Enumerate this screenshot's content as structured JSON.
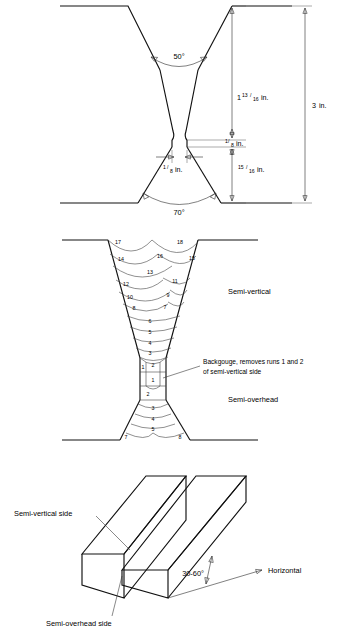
{
  "figure": {
    "ink_color": "#111111",
    "background_color": "#ffffff"
  },
  "groove_detail": {
    "name": "groove-preparation-cross-section",
    "upper_angle": "50°",
    "lower_angle": "70°",
    "root_gap": {
      "whole": "",
      "num": "1",
      "den": "8",
      "unit": "in."
    },
    "upper_depth": {
      "whole": "1",
      "num": "13",
      "den": "16",
      "unit": "in."
    },
    "root_face": {
      "whole": "",
      "num": "1",
      "den": "8",
      "unit": "in."
    },
    "lower_depth": {
      "whole": "",
      "num": "15",
      "den": "16",
      "unit": "in."
    },
    "total_thickness": {
      "whole": "3",
      "num": "",
      "den": "",
      "unit": "in."
    }
  },
  "run_sequence": {
    "name": "weld-run-sequence",
    "semi_vertical_label": "Semi-vertical",
    "semi_overhead_label": "Semi-overhead",
    "backgouge_note_line1": "Backgouge, removes runs 1 and 2",
    "backgouge_note_line2": "of semi-vertical side",
    "semi_vertical_runs": [
      {
        "n": "17",
        "x": 118,
        "y": 16
      },
      {
        "n": "18",
        "x": 180,
        "y": 16
      },
      {
        "n": "14",
        "x": 121,
        "y": 33
      },
      {
        "n": "16",
        "x": 160,
        "y": 30
      },
      {
        "n": "15",
        "x": 192,
        "y": 32
      },
      {
        "n": "13",
        "x": 150,
        "y": 46
      },
      {
        "n": "12",
        "x": 126,
        "y": 58
      },
      {
        "n": "11",
        "x": 175,
        "y": 55
      },
      {
        "n": "10",
        "x": 130,
        "y": 71
      },
      {
        "n": "9",
        "x": 168,
        "y": 69
      },
      {
        "n": "8",
        "x": 134,
        "y": 82
      },
      {
        "n": "7",
        "x": 165,
        "y": 81
      },
      {
        "n": "6",
        "x": 150,
        "y": 93
      },
      {
        "n": "5",
        "x": 150,
        "y": 104
      },
      {
        "n": "4",
        "x": 150,
        "y": 114
      },
      {
        "n": "3",
        "x": 150,
        "y": 124
      },
      {
        "n": "2",
        "x": 152,
        "y": 134
      },
      {
        "n": "1",
        "x": 139,
        "y": 137
      }
    ],
    "semi_overhead_runs": [
      {
        "n": "1",
        "x": 152,
        "y": 150
      },
      {
        "n": "2",
        "x": 146,
        "y": 163
      },
      {
        "n": "3",
        "x": 150,
        "y": 178
      },
      {
        "n": "4",
        "x": 150,
        "y": 190
      },
      {
        "n": "5",
        "x": 150,
        "y": 200
      },
      {
        "n": "6",
        "x": 150,
        "y": 190
      },
      {
        "n": "7",
        "x": 124,
        "y": 208
      },
      {
        "n": "8",
        "x": 178,
        "y": 208
      }
    ]
  },
  "isometric": {
    "name": "plate-orientation-isometric",
    "semi_vertical_side_label": "Semi-vertical side",
    "semi_overhead_side_label": "Semi-overhead side",
    "inclination_label": "30-60°",
    "horizontal_label": "Horizontal"
  }
}
